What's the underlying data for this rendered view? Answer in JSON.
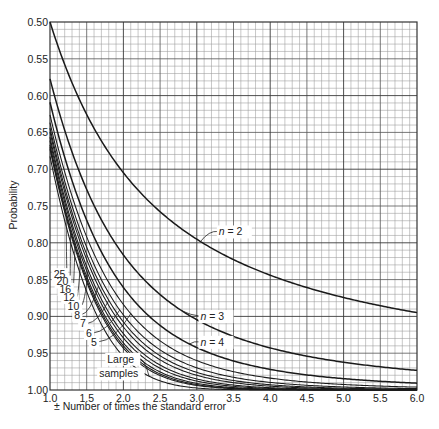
{
  "chart_data": {
    "type": "line",
    "title": "",
    "xlabel": "± Number of times the standard error",
    "ylabel": "Probability",
    "xlim": [
      1.0,
      6.0
    ],
    "ylim": [
      0.5,
      1.0
    ],
    "y_inverted": true,
    "grid": true,
    "x_ticks": [
      "1.0",
      "1.5",
      "2.0",
      "2.5",
      "3.0",
      "3.5",
      "4.0",
      "4.5",
      "5.0",
      "5.5",
      "6.0"
    ],
    "y_ticks": [
      "0.50",
      "0.55",
      "0.60",
      "0.65",
      "0.70",
      "0.75",
      "0.80",
      "0.85",
      "0.90",
      "0.95",
      "1.00"
    ],
    "x": [
      1.0,
      1.5,
      2.0,
      2.5,
      3.0,
      3.5,
      4.0,
      4.5,
      5.0,
      5.5,
      6.0
    ],
    "series": [
      {
        "name": "n = 2",
        "df": 1,
        "values": [
          0.5,
          0.626,
          0.705,
          0.758,
          0.795,
          0.823,
          0.844,
          0.86,
          0.874,
          0.886,
          0.895
        ]
      },
      {
        "name": "n = 3",
        "df": 2,
        "values": [
          0.577,
          0.728,
          0.816,
          0.87,
          0.905,
          0.927,
          0.943,
          0.954,
          0.962,
          0.968,
          0.973
        ]
      },
      {
        "name": "n = 4",
        "df": 3,
        "values": [
          0.609,
          0.769,
          0.861,
          0.912,
          0.942,
          0.96,
          0.972,
          0.98,
          0.985,
          0.988,
          0.991
        ]
      },
      {
        "name": "5",
        "df": 4,
        "values": [
          0.626,
          0.792,
          0.884,
          0.933,
          0.96,
          0.975,
          0.984,
          0.989,
          0.993,
          0.995,
          0.996
        ]
      },
      {
        "name": "6",
        "df": 5,
        "values": [
          0.637,
          0.806,
          0.898,
          0.946,
          0.97,
          0.983,
          0.99,
          0.994,
          0.996,
          0.997,
          0.998
        ]
      },
      {
        "name": "7",
        "df": 6,
        "values": [
          0.644,
          0.816,
          0.908,
          0.953,
          0.976,
          0.987,
          0.993,
          0.996,
          0.998,
          0.999,
          0.999
        ]
      },
      {
        "name": "8",
        "df": 7,
        "values": [
          0.649,
          0.823,
          0.914,
          0.959,
          0.98,
          0.99,
          0.995,
          0.997,
          0.998,
          0.999,
          1.0
        ]
      },
      {
        "name": "10",
        "df": 9,
        "values": [
          0.657,
          0.832,
          0.923,
          0.966,
          0.985,
          0.993,
          0.997,
          0.999,
          0.999,
          1.0,
          1.0
        ]
      },
      {
        "name": "12",
        "df": 11,
        "values": [
          0.661,
          0.838,
          0.929,
          0.97,
          0.988,
          0.995,
          0.998,
          0.999,
          1.0,
          1.0,
          1.0
        ]
      },
      {
        "name": "16",
        "df": 15,
        "values": [
          0.667,
          0.846,
          0.936,
          0.975,
          0.991,
          0.997,
          0.999,
          1.0,
          1.0,
          1.0,
          1.0
        ]
      },
      {
        "name": "20",
        "df": 19,
        "values": [
          0.67,
          0.85,
          0.94,
          0.978,
          0.993,
          0.998,
          0.999,
          1.0,
          1.0,
          1.0,
          1.0
        ]
      },
      {
        "name": "25",
        "df": 24,
        "values": [
          0.673,
          0.853,
          0.943,
          0.98,
          0.994,
          0.998,
          1.0,
          1.0,
          1.0,
          1.0,
          1.0
        ]
      },
      {
        "name": "Large samples",
        "df": 0,
        "values": [
          0.683,
          0.866,
          0.954,
          0.988,
          0.997,
          1.0,
          1.0,
          1.0,
          1.0,
          1.0,
          1.0
        ]
      }
    ],
    "annotations": [
      {
        "text": "n = 2",
        "x": 3.3,
        "y": 0.79
      },
      {
        "text": "n = 3",
        "x": 3.05,
        "y": 0.905
      },
      {
        "text": "n = 4",
        "x": 3.05,
        "y": 0.94
      },
      {
        "text": "25",
        "x": 1.05,
        "y": 0.848
      },
      {
        "text": "20",
        "x": 1.09,
        "y": 0.858
      },
      {
        "text": "16",
        "x": 1.13,
        "y": 0.868
      },
      {
        "text": "12",
        "x": 1.18,
        "y": 0.879
      },
      {
        "text": "10",
        "x": 1.24,
        "y": 0.891
      },
      {
        "text": "8",
        "x": 1.33,
        "y": 0.903
      },
      {
        "text": "7",
        "x": 1.41,
        "y": 0.915
      },
      {
        "text": "6",
        "x": 1.49,
        "y": 0.928
      },
      {
        "text": "5",
        "x": 1.56,
        "y": 0.94
      },
      {
        "text": "Large",
        "x": 1.78,
        "y": 0.963
      },
      {
        "text": "samples",
        "x": 1.67,
        "y": 0.983
      }
    ]
  }
}
